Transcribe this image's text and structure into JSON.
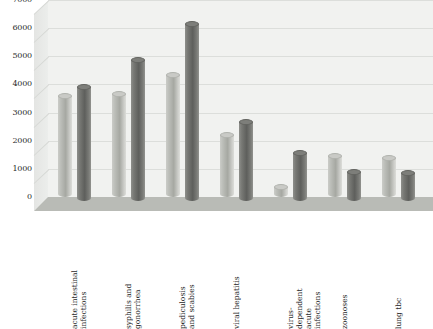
{
  "chart_data": {
    "type": "bar",
    "title": "",
    "subtitle": "",
    "xlabel": "",
    "ylabel": "",
    "ylim": [
      0,
      7000
    ],
    "ytick_step": 1000,
    "yticks": [
      "7000",
      "6000",
      "5000",
      "4000",
      "3000",
      "2000",
      "1000",
      "0"
    ],
    "grid": true,
    "legend": "none",
    "style": "3d-cylinder-grouped",
    "categories": [
      "acute intestinal\ninfections",
      "syphilis and\ngonorrhea",
      "pediculosis\nand scabies",
      "viral hepatitis",
      "virus-dependent\nacute infections",
      "zoonoses",
      "lung tbc"
    ],
    "series": [
      {
        "name": "series-1",
        "color": "#b5b7b2",
        "values": [
          3700,
          3750,
          4450,
          2300,
          450,
          1550,
          1500
        ]
      },
      {
        "name": "series-2",
        "color": "#6e6f6b",
        "values": [
          4150,
          5100,
          6400,
          2900,
          1800,
          1150,
          1100
        ]
      }
    ]
  },
  "palette": {
    "background": "#ffffff",
    "back_wall": "#f1f2f0",
    "left_wall": "#e8e9e7",
    "floor": "#b9bbb6",
    "gridline": "#dcdedb",
    "text": "#2a2a2a"
  }
}
